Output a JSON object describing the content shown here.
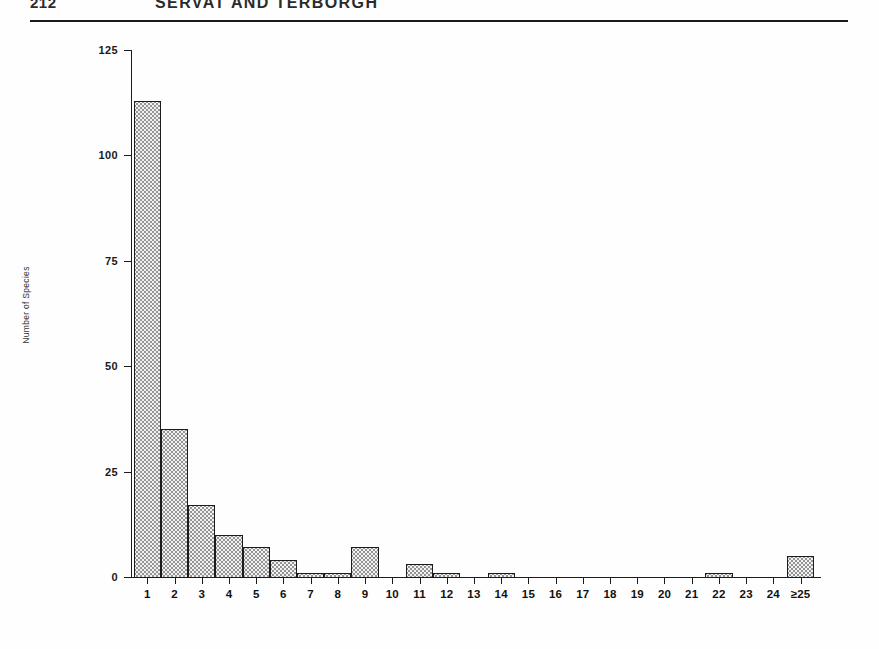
{
  "running_head": {
    "folio": "212",
    "title": "SERVAT AND TERBORGH"
  },
  "figure": {
    "y_axis_title": "Number of Species"
  },
  "chart_data": {
    "type": "bar",
    "title": "",
    "xlabel": "",
    "ylabel": "Number of Species",
    "categories": [
      "1",
      "2",
      "3",
      "4",
      "5",
      "6",
      "7",
      "8",
      "9",
      "10",
      "11",
      "12",
      "13",
      "14",
      "15",
      "16",
      "17",
      "18",
      "19",
      "20",
      "21",
      "22",
      "23",
      "24",
      "≥25"
    ],
    "values": [
      113,
      35,
      17,
      10,
      7,
      4,
      1,
      1,
      7,
      0,
      3,
      1,
      0,
      1,
      0,
      0,
      0,
      0,
      0,
      0,
      0,
      1,
      0,
      0,
      5
    ],
    "ylim": [
      0,
      125
    ],
    "yticks": [
      0,
      25,
      50,
      75,
      100,
      125
    ],
    "ytick_labels": [
      "0",
      "25",
      "50",
      "75",
      "100",
      "125"
    ],
    "xlim": [
      0.5,
      25.5
    ],
    "grid": false,
    "legend": null,
    "bar_style": "stippled-fill-black-outline"
  }
}
